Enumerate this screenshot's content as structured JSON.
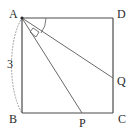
{
  "figure": {
    "type": "geometry-diagram",
    "background_color": "#ffffff",
    "stroke_color": "#4a4a4a",
    "dotted_color": "#8a8a8a",
    "label_color": "#2b2b2b"
  },
  "square": {
    "name": "ABCD",
    "vertices": [
      {
        "id": "A",
        "label": "A",
        "x": 22,
        "y": 18,
        "label_x": 9,
        "label_y": 8
      },
      {
        "id": "D",
        "label": "D",
        "x": 113,
        "y": 18,
        "label_x": 117,
        "label_y": 8
      },
      {
        "id": "C",
        "label": "C",
        "x": 113,
        "y": 113,
        "label_x": 118,
        "label_y": 113
      },
      {
        "id": "B",
        "label": "B",
        "x": 22,
        "y": 113,
        "label_x": 9,
        "label_y": 113
      }
    ]
  },
  "points": [
    {
      "id": "Q",
      "label": "Q",
      "x": 113,
      "y": 78,
      "label_x": 117,
      "label_y": 75,
      "on_side": "DC"
    },
    {
      "id": "P",
      "label": "P",
      "x": 82,
      "y": 113,
      "label_x": 79,
      "label_y": 117,
      "on_side": "BC"
    }
  ],
  "segments": [
    {
      "id": "AB",
      "from": "A",
      "to": "B",
      "style": "solid"
    },
    {
      "id": "AD",
      "from": "A",
      "to": "D",
      "style": "solid"
    },
    {
      "id": "DC",
      "from": "D",
      "to": "C",
      "style": "solid"
    },
    {
      "id": "BC",
      "from": "B",
      "to": "C",
      "style": "solid"
    },
    {
      "id": "AQ",
      "from": "A",
      "to": "Q",
      "style": "solid"
    },
    {
      "id": "AP",
      "from": "A",
      "to": "P",
      "style": "solid"
    }
  ],
  "measures": [
    {
      "id": "side-ab",
      "label": "3",
      "x": 7,
      "y": 58,
      "refers_to": "AB"
    }
  ],
  "annotations": {
    "angle_arc": {
      "name": "angle-arc-DAQ",
      "at_vertex": "A",
      "between": [
        "AD",
        "AQ"
      ]
    },
    "angle_marker": {
      "name": "angle-marker-QAP",
      "at_vertex": "A",
      "between": [
        "AQ",
        "AP"
      ],
      "shape": "quadrilateral"
    },
    "dotted_arc": {
      "name": "dotted-arc-AB",
      "from": "A",
      "to": "B",
      "bulge": "left"
    },
    "vertex_dot": {
      "name": "vertex-dot-A",
      "at_vertex": "A"
    }
  }
}
